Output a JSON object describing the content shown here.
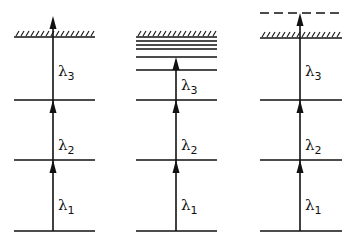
{
  "diagram": {
    "type": "energy-level ionization schemes",
    "line_color": "#111111",
    "background": "#ffffff",
    "panels": [
      {
        "id": "panel-1",
        "description": "Three-step excitation to above ionization limit",
        "x_left": 14,
        "x_right": 95,
        "x_axis": 53,
        "ground_y": 231,
        "levels_y": [
          160,
          100
        ],
        "ionization_limit_y": 37,
        "extra_lines_y": [],
        "dashed_level_y": null,
        "arrow_top_y": 16,
        "labels": [
          {
            "greek": "λ",
            "sub": "1",
            "y": 210
          },
          {
            "greek": "λ",
            "sub": "2",
            "y": 150
          },
          {
            "greek": "λ",
            "sub": "3",
            "y": 76
          }
        ]
      },
      {
        "id": "panel-2",
        "description": "Three-step excitation to high-lying Rydberg state below limit",
        "x_left": 136,
        "x_right": 217,
        "x_axis": 176,
        "ground_y": 231,
        "levels_y": [
          160,
          100,
          70,
          57
        ],
        "ionization_limit_y": 37,
        "extra_lines_y": [
          41,
          45,
          49
        ],
        "dashed_level_y": null,
        "arrow_top_y": 57,
        "labels": [
          {
            "greek": "λ",
            "sub": "1",
            "y": 210
          },
          {
            "greek": "λ",
            "sub": "2",
            "y": 150
          },
          {
            "greek": "λ",
            "sub": "3",
            "y": 90
          }
        ]
      },
      {
        "id": "panel-3",
        "description": "Three-step excitation to autoionizing state above limit",
        "x_left": 260,
        "x_right": 342,
        "x_axis": 300,
        "ground_y": 231,
        "levels_y": [
          160,
          100
        ],
        "ionization_limit_y": 38,
        "extra_lines_y": [],
        "dashed_level_y": 13,
        "arrow_top_y": 13,
        "labels": [
          {
            "greek": "λ",
            "sub": "1",
            "y": 210
          },
          {
            "greek": "λ",
            "sub": "2",
            "y": 150
          },
          {
            "greek": "λ",
            "sub": "3",
            "y": 76
          }
        ]
      }
    ]
  }
}
